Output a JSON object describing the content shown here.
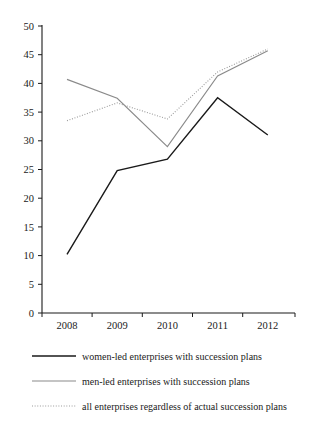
{
  "chart_data": {
    "type": "line",
    "title": "",
    "subtitle": "",
    "xlabel": "",
    "ylabel": "",
    "categories": [
      "2008",
      "2009",
      "2010",
      "2011",
      "2012"
    ],
    "x_tick_labels": [
      "2008",
      "2009",
      "2010",
      "2011",
      "2012"
    ],
    "y_tick_labels": [
      "0",
      "5",
      "10",
      "15",
      "20",
      "25",
      "30",
      "35",
      "40",
      "45",
      "50"
    ],
    "y_ticks": [
      0,
      5,
      10,
      15,
      20,
      25,
      30,
      35,
      40,
      45,
      50
    ],
    "ylim": [
      0,
      50
    ],
    "grid": false,
    "legend_position": "bottom",
    "series": [
      {
        "name": "women-led enterprises with succession plans",
        "values": [
          10.2,
          24.8,
          26.8,
          37.5,
          31.0
        ],
        "color": "#1a1a1a",
        "style": "solid",
        "width": 1.4
      },
      {
        "name": "men-led enterprises with succession plans",
        "values": [
          40.7,
          37.4,
          29.0,
          41.3,
          45.7
        ],
        "color": "#8a8a8a",
        "style": "solid",
        "width": 1.1
      },
      {
        "name": "all enterprises regardless of actual succession plans",
        "values": [
          33.5,
          36.6,
          33.8,
          42.0,
          46.0
        ],
        "color": "#9a9a9a",
        "style": "dotted",
        "width": 1.1
      }
    ]
  },
  "legend": {
    "items": [
      {
        "label": "women-led enterprises with succession plans"
      },
      {
        "label": "men-led enterprises with succession plans"
      },
      {
        "label": "all enterprises regardless of actual succession plans"
      }
    ]
  },
  "axis": {
    "line_color": "#1a1a1a"
  }
}
